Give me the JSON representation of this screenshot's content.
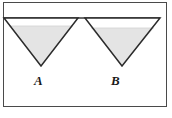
{
  "figure": {
    "caption_labels": [
      "A",
      "B"
    ],
    "background_color": "#ffffff",
    "frame": {
      "border_color": "#4a4a4a",
      "fill_color": "#ffffff"
    },
    "rim_line": {
      "name": "triangle-rim-line",
      "color": "#3a3a3a"
    },
    "shapes": [
      {
        "name": "triangle-a",
        "label": "A",
        "orientation": "inverted",
        "outline_color": "#2b2b2b",
        "fill_color": "#e4e4e4",
        "empty_color": "#ffffff",
        "top_left_x": 4,
        "top_right_x": 78,
        "top_y": 18,
        "apex_x": 41,
        "apex_y": 66,
        "fill_level_y": 26
      },
      {
        "name": "triangle-b",
        "label": "B",
        "orientation": "inverted",
        "outline_color": "#2b2b2b",
        "fill_color": "#e4e4e4",
        "empty_color": "#ffffff",
        "top_left_x": 85,
        "top_right_x": 160,
        "top_y": 18,
        "apex_x": 122,
        "apex_y": 66,
        "fill_level_y": 28
      }
    ]
  },
  "labels": {
    "a": "A",
    "b": "B"
  }
}
